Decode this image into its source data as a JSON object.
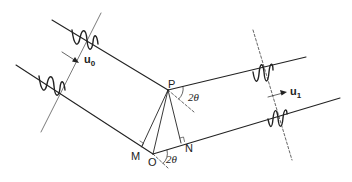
{
  "diagram": {
    "points": {
      "P": "P",
      "O": "O",
      "M": "M",
      "N": "N"
    },
    "angle_label_top": "2θ",
    "angle_label_bottom": "2θ",
    "incident_vector": {
      "symbol": "u",
      "subscript": "0"
    },
    "scattered_vector": {
      "symbol": "u",
      "subscript": "1"
    },
    "colors": {
      "line": "#222222",
      "background": "#ffffff"
    }
  }
}
